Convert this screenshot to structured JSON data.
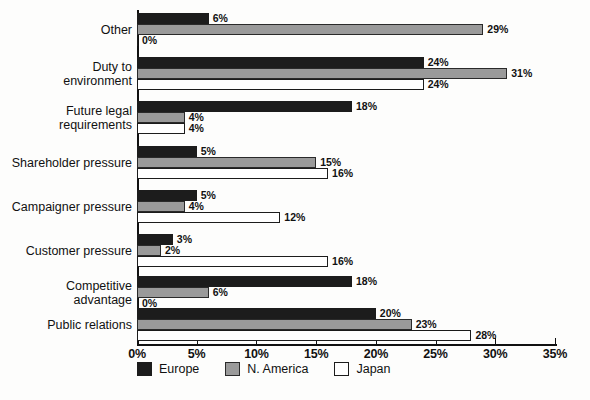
{
  "chart_data": {
    "type": "bar",
    "orientation": "horizontal",
    "title": "",
    "xlabel": "",
    "ylabel": "",
    "xlim": [
      0,
      35
    ],
    "grid": false,
    "legend_position": "bottom",
    "xtick_labels": [
      "0%",
      "5%",
      "10%",
      "15%",
      "20%",
      "25%",
      "30%",
      "35%"
    ],
    "xtick_values": [
      0,
      5,
      10,
      15,
      20,
      25,
      30,
      35
    ],
    "categories": [
      "Other",
      "Duty to\nenvironment",
      "Future legal\nrequirements",
      "Shareholder pressure",
      "Campaigner pressure",
      "Customer pressure",
      "Competitive\nadvantage",
      "Public relations"
    ],
    "series": [
      {
        "name": "Europe",
        "color": "#1c1c1c",
        "values": [
          6,
          24,
          18,
          5,
          5,
          3,
          18,
          20
        ]
      },
      {
        "name": "N. America",
        "color": "#9a9a9a",
        "values": [
          29,
          31,
          4,
          15,
          4,
          2,
          6,
          23
        ]
      },
      {
        "name": "Japan",
        "color": "#ffffff",
        "values": [
          0,
          24,
          4,
          16,
          12,
          16,
          0,
          28
        ]
      }
    ],
    "value_labels": [
      [
        "6%",
        "29%",
        "0%"
      ],
      [
        "24%",
        "31%",
        "24%"
      ],
      [
        "18%",
        "4%",
        "4%"
      ],
      [
        "5%",
        "15%",
        "16%"
      ],
      [
        "5%",
        "4%",
        "12%"
      ],
      [
        "3%",
        "2%",
        "16%"
      ],
      [
        "18%",
        "6%",
        "0%"
      ],
      [
        "20%",
        "23%",
        "28%"
      ]
    ]
  },
  "legend": {
    "items": [
      {
        "label": "Europe",
        "swatch": "black-square-icon"
      },
      {
        "label": "N. America",
        "swatch": "gray-square-icon"
      },
      {
        "label": "Japan",
        "swatch": "white-square-icon"
      }
    ]
  }
}
